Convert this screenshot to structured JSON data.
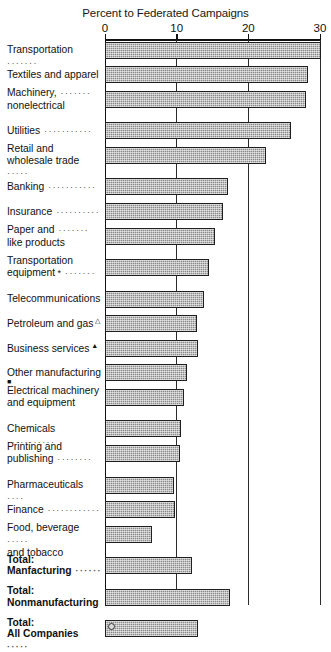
{
  "chart_data": {
    "type": "bar",
    "orientation": "horizontal",
    "title": "",
    "xlabel": "Percent to Federated Campaigns",
    "ylabel": "",
    "xlim": [
      0,
      30.8
    ],
    "xticks": [
      0,
      10,
      20,
      30
    ],
    "xticklabels": [
      "0",
      "10",
      "20",
      "30"
    ],
    "grid": true,
    "grid_axis": "x",
    "legend": "none",
    "bar_color": "#8a8a8a",
    "bar_edge_color": "#1f1f1f",
    "categories": [
      "Transportation",
      "Textiles and apparel",
      "Machinery, nonelectrical",
      "Utilities",
      "Retail and wholesale trade",
      "Banking",
      "Insurance",
      "Paper and like products",
      "Transportation equipment *",
      "Telecommunications",
      "Petroleum and gas △",
      "Business services ▲",
      "Other manufacturing ■",
      "Electrical machinery and equipment",
      "Chemicals",
      "Printing and publishing",
      "Pharmaceuticals",
      "Finance",
      "Food, beverage and tobacco",
      "Total: Manfacturing",
      "Total: Nonmanufacturing",
      "Total: All Companies"
    ],
    "values": [
      30.2,
      28.3,
      28.1,
      26.0,
      22.5,
      17.2,
      16.5,
      15.3,
      14.5,
      13.8,
      12.9,
      13.0,
      11.5,
      11.0,
      10.6,
      10.5,
      9.6,
      9.7,
      6.5,
      12.1,
      17.5,
      13.0
    ]
  },
  "axis": {
    "title": "Percent to Federated Campaigns",
    "ticks": [
      {
        "label": "0",
        "value": 0
      },
      {
        "label": "10",
        "value": 10
      },
      {
        "label": "20",
        "value": 20
      },
      {
        "label": "30",
        "value": 30
      }
    ]
  },
  "rows": [
    {
      "name": "transportation",
      "lines": [
        "Transportation"
      ],
      "leader": "·······",
      "leader_line": 0,
      "marker": "",
      "value": 30.2,
      "bold": false,
      "two_line": false
    },
    {
      "name": "textiles-and-apparel",
      "lines": [
        "Textiles and apparel"
      ],
      "leader": "",
      "leader_line": 0,
      "marker": "",
      "value": 28.3,
      "bold": false,
      "two_line": false
    },
    {
      "name": "machinery-nonelectrical",
      "lines": [
        "Machinery,",
        "nonelectrical"
      ],
      "leader": "·······",
      "leader_line": 0,
      "marker": "",
      "value": 28.1,
      "bold": false,
      "two_line": true
    },
    {
      "name": "utilities",
      "lines": [
        "Utilities"
      ],
      "leader": "···········",
      "leader_line": 0,
      "marker": "",
      "value": 26.0,
      "bold": false,
      "two_line": false
    },
    {
      "name": "retail-and-wholesale-trade",
      "lines": [
        "Retail and",
        "wholesale trade"
      ],
      "leader": "·····",
      "leader_line": 1,
      "marker": "",
      "value": 22.5,
      "bold": false,
      "two_line": true
    },
    {
      "name": "banking",
      "lines": [
        "Banking"
      ],
      "leader": "···········",
      "leader_line": 0,
      "marker": "",
      "value": 17.2,
      "bold": false,
      "two_line": false
    },
    {
      "name": "insurance",
      "lines": [
        "Insurance"
      ],
      "leader": "··········",
      "leader_line": 0,
      "marker": "",
      "value": 16.5,
      "bold": false,
      "two_line": false
    },
    {
      "name": "paper-and-like-products",
      "lines": [
        "Paper and",
        "like products"
      ],
      "leader": "·······",
      "leader_line": 0,
      "marker": "",
      "value": 15.3,
      "bold": false,
      "two_line": true
    },
    {
      "name": "transportation-equipment",
      "lines": [
        "Transportation",
        "equipment"
      ],
      "leader": "·······",
      "leader_line": 1,
      "marker": "*",
      "value": 14.5,
      "bold": false,
      "two_line": true
    },
    {
      "name": "telecommunications",
      "lines": [
        "Telecommunications"
      ],
      "leader": "",
      "leader_line": 0,
      "marker": "",
      "value": 13.8,
      "bold": false,
      "two_line": false
    },
    {
      "name": "petroleum-and-gas",
      "lines": [
        "Petroleum and gas"
      ],
      "leader": "",
      "leader_line": 0,
      "marker": "△",
      "value": 12.9,
      "bold": false,
      "two_line": false
    },
    {
      "name": "business-services",
      "lines": [
        "Business services"
      ],
      "leader": "",
      "leader_line": 0,
      "marker": "▲",
      "value": 13.0,
      "bold": false,
      "two_line": false
    },
    {
      "name": "other-manufacturing",
      "lines": [
        "Other manufacturing"
      ],
      "leader": "",
      "leader_line": 0,
      "marker": "■",
      "value": 11.5,
      "bold": false,
      "two_line": false
    },
    {
      "name": "electrical-machinery-and-equipment",
      "lines": [
        "Electrical machinery",
        "and equipment"
      ],
      "leader": "",
      "leader_line": 0,
      "marker": "",
      "value": 11.0,
      "bold": false,
      "two_line": true
    },
    {
      "name": "chemicals",
      "lines": [
        "Chemicals"
      ],
      "leader": "···········",
      "leader_line": 0,
      "marker": "",
      "value": 10.6,
      "bold": false,
      "two_line": false
    },
    {
      "name": "printing-and-publishing",
      "lines": [
        "Printing and",
        "publishing"
      ],
      "leader": "········",
      "leader_line": 1,
      "marker": "",
      "value": 10.5,
      "bold": false,
      "two_line": true
    },
    {
      "name": "pharmaceuticals",
      "lines": [
        "Pharmaceuticals"
      ],
      "leader": "····",
      "leader_line": 0,
      "marker": "",
      "value": 9.6,
      "bold": false,
      "two_line": false
    },
    {
      "name": "finance",
      "lines": [
        "Finance"
      ],
      "leader": "············",
      "leader_line": 0,
      "marker": "",
      "value": 9.7,
      "bold": false,
      "two_line": false
    },
    {
      "name": "food-beverage-and-tobacco",
      "lines": [
        "Food, beverage",
        "and tobacco"
      ],
      "leader": "·····",
      "leader_line": 0,
      "marker": "",
      "value": 6.5,
      "bold": false,
      "two_line": true
    },
    {
      "name": "total-manufacturing",
      "lines": [
        "Total:",
        "Manfacturing"
      ],
      "leader": "······",
      "leader_line": 1,
      "marker": "",
      "value": 12.1,
      "bold": true,
      "two_line": true
    },
    {
      "name": "total-nonmanufacturing",
      "lines": [
        "Total:",
        "Nonmanufacturing"
      ],
      "leader": "",
      "leader_line": 0,
      "marker": "",
      "value": 17.5,
      "bold": true,
      "two_line": true
    },
    {
      "name": "total-all-companies",
      "lines": [
        "Total:",
        "All Companies"
      ],
      "leader": "·····",
      "leader_line": 1,
      "marker": "",
      "value": 13.0,
      "bold": true,
      "two_line": true
    }
  ]
}
